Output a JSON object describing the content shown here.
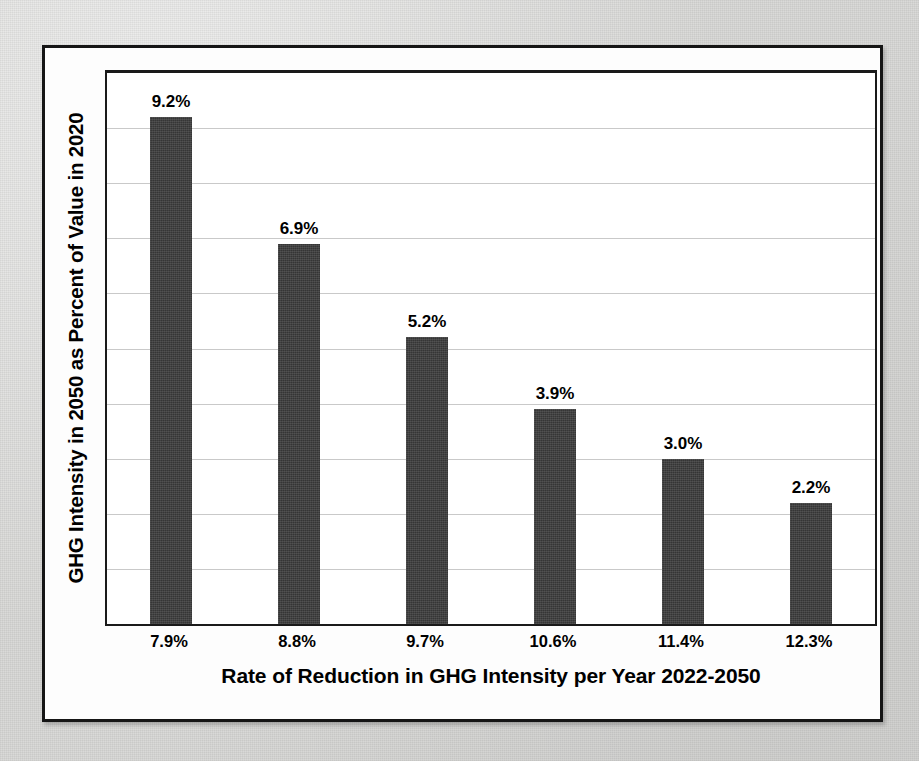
{
  "figure": {
    "background_color": "#d8d8d6",
    "frame_color": "#151515",
    "plot_background": "#ffffff",
    "bar_color": "#3a3a3a",
    "gridline_color": "#c9c9c9"
  },
  "chart_data": {
    "type": "bar",
    "title": "",
    "subtitle": "",
    "xlabel": "Rate of Reduction in GHG Intensity per Year 2022-2050",
    "ylabel": "GHG Intensity in 2050 as Percent of Value in 2020",
    "categories": [
      "7.9%",
      "8.8%",
      "9.7%",
      "10.6%",
      "11.4%",
      "12.3%"
    ],
    "values": [
      9.2,
      6.9,
      5.2,
      3.9,
      3.0,
      2.2
    ],
    "data_labels": [
      "9.2%",
      "6.9%",
      "5.2%",
      "3.9%",
      "3.0%",
      "2.2%"
    ],
    "series": [
      {
        "name": "GHG Intensity in 2050 as Percent of Value in 2020",
        "values": [
          9.2,
          6.9,
          5.2,
          3.9,
          3.0,
          2.2
        ]
      }
    ],
    "ylim": [
      0,
      10.0
    ],
    "ytick_labels_shown": false,
    "ytick_count": 10,
    "grid": true,
    "grid_axis": "y",
    "legend": false,
    "legend_position": "none",
    "units": "percent"
  }
}
